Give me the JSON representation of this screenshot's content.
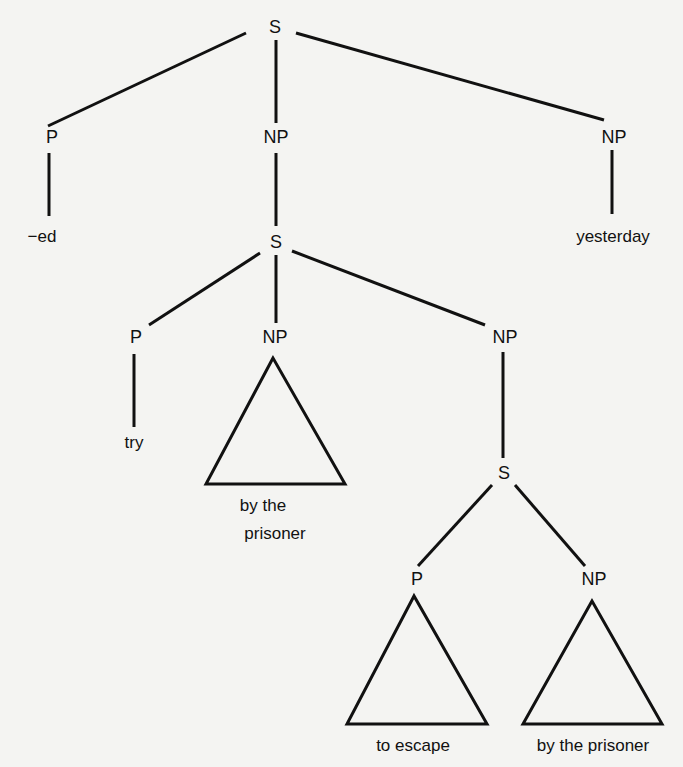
{
  "diagram": {
    "nodes": [
      {
        "id": "S0",
        "label": "S",
        "x": 275,
        "y": 27
      },
      {
        "id": "P1",
        "label": "P",
        "x": 52,
        "y": 137
      },
      {
        "id": "NP1",
        "label": "NP",
        "x": 276,
        "y": 137
      },
      {
        "id": "NP2",
        "label": "NP",
        "x": 614,
        "y": 137
      },
      {
        "id": "L_ed",
        "label": "−ed",
        "x": 42,
        "y": 236,
        "leaf": true
      },
      {
        "id": "S1",
        "label": "S",
        "x": 276,
        "y": 242
      },
      {
        "id": "L_yesterday",
        "label": "yesterday",
        "x": 613,
        "y": 236,
        "leaf": true
      },
      {
        "id": "P2",
        "label": "P",
        "x": 136,
        "y": 337
      },
      {
        "id": "NP3",
        "label": "NP",
        "x": 275,
        "y": 337
      },
      {
        "id": "NP4",
        "label": "NP",
        "x": 505,
        "y": 337
      },
      {
        "id": "L_try",
        "label": "try",
        "x": 134,
        "y": 442,
        "leaf": true
      },
      {
        "id": "L_bytheprisoner1a",
        "label": "by the",
        "x": 263,
        "y": 505,
        "leaf": true
      },
      {
        "id": "L_bytheprisoner1b",
        "label": "prisoner",
        "x": 275,
        "y": 533,
        "leaf": true
      },
      {
        "id": "S2",
        "label": "S",
        "x": 504,
        "y": 473
      },
      {
        "id": "P3",
        "label": "P",
        "x": 417,
        "y": 579
      },
      {
        "id": "NP5",
        "label": "NP",
        "x": 594,
        "y": 579
      },
      {
        "id": "L_toescape",
        "label": "to escape",
        "x": 413,
        "y": 745,
        "leaf": true
      },
      {
        "id": "L_bytheprisoner2",
        "label": "by the prisoner",
        "x": 593,
        "y": 745,
        "leaf": true
      }
    ],
    "edges": [
      [
        246,
        33,
        48,
        126
      ],
      [
        276,
        40,
        276,
        123
      ],
      [
        296,
        33,
        604,
        120
      ],
      [
        49,
        153,
        49,
        216
      ],
      [
        276,
        153,
        276,
        226
      ],
      [
        612,
        150,
        612,
        214
      ],
      [
        260,
        253,
        149,
        325
      ],
      [
        276,
        255,
        276,
        323
      ],
      [
        292,
        251,
        485,
        325
      ],
      [
        134,
        354,
        134,
        427
      ],
      [
        503,
        352,
        503,
        458
      ],
      [
        492,
        485,
        418,
        566
      ],
      [
        515,
        485,
        585,
        566
      ]
    ],
    "triangles": [
      [
        [
          273,
          358
        ],
        [
          206,
          484
        ],
        [
          345,
          484
        ]
      ],
      [
        [
          414,
          596
        ],
        [
          347,
          724
        ],
        [
          487,
          724
        ]
      ],
      [
        [
          592,
          601
        ],
        [
          523,
          724
        ],
        [
          662,
          724
        ]
      ]
    ]
  }
}
